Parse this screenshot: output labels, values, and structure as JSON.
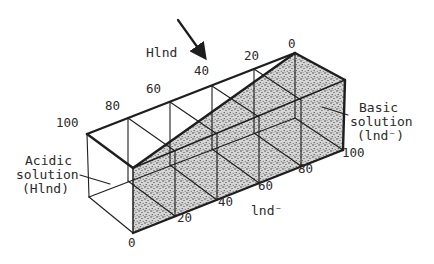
{
  "diagram": {
    "type": "3d-wedge-box",
    "axis_top": {
      "label": "Hlnd",
      "ticks": [
        "100",
        "80",
        "60",
        "40",
        "20",
        "0"
      ]
    },
    "axis_bottom": {
      "label": "lnd⁻",
      "ticks": [
        "0",
        "20",
        "40",
        "60",
        "80",
        "100"
      ]
    },
    "annotations": {
      "left": {
        "line1": "Acidic",
        "line2": "solution",
        "line3": "(Hlnd)"
      },
      "right": {
        "line1": "Basic",
        "line2": "solution",
        "line3": "(lnd⁻)"
      }
    },
    "arrow": {
      "direction": "down-right",
      "points_to": "40"
    },
    "colors": {
      "ink": "#1e1e1e",
      "background": "#ffffff",
      "stipple": "#2b2b2b"
    }
  }
}
